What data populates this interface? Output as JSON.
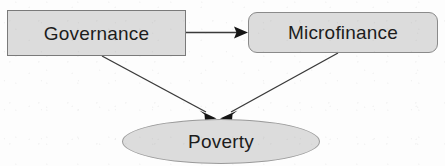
{
  "diagram": {
    "background_color": "#fdfdfd",
    "node_fill_color": "#dcdcdc",
    "node_border_color": "#7a7a7a",
    "edge_color": "#3a3a3a",
    "text_color": "#1c1c1c",
    "nodes": [
      {
        "id": "governance",
        "label": "Governance",
        "shape": "rectangle",
        "x": 7,
        "y": 10,
        "width": 179,
        "height": 46
      },
      {
        "id": "microfinance",
        "label": "Microfinance",
        "shape": "rounded-rectangle",
        "x": 248,
        "y": 12,
        "width": 190,
        "height": 41
      },
      {
        "id": "poverty",
        "label": "Poverty",
        "shape": "ellipse",
        "x": 122,
        "y": 119,
        "width": 198,
        "height": 45
      }
    ],
    "edges": [
      {
        "id": "governance-to-microfinance",
        "from": "governance",
        "to": "microfinance",
        "style": "solid",
        "arrowhead": "filled-triangle",
        "orientation": "horizontal"
      },
      {
        "id": "governance-to-poverty",
        "from": "governance",
        "to": "poverty",
        "style": "solid",
        "arrowhead": "filled-triangle",
        "orientation": "diagonal-down-right"
      },
      {
        "id": "microfinance-to-poverty",
        "from": "microfinance",
        "to": "poverty",
        "style": "solid",
        "arrowhead": "filled-triangle",
        "orientation": "diagonal-down-left"
      }
    ]
  }
}
